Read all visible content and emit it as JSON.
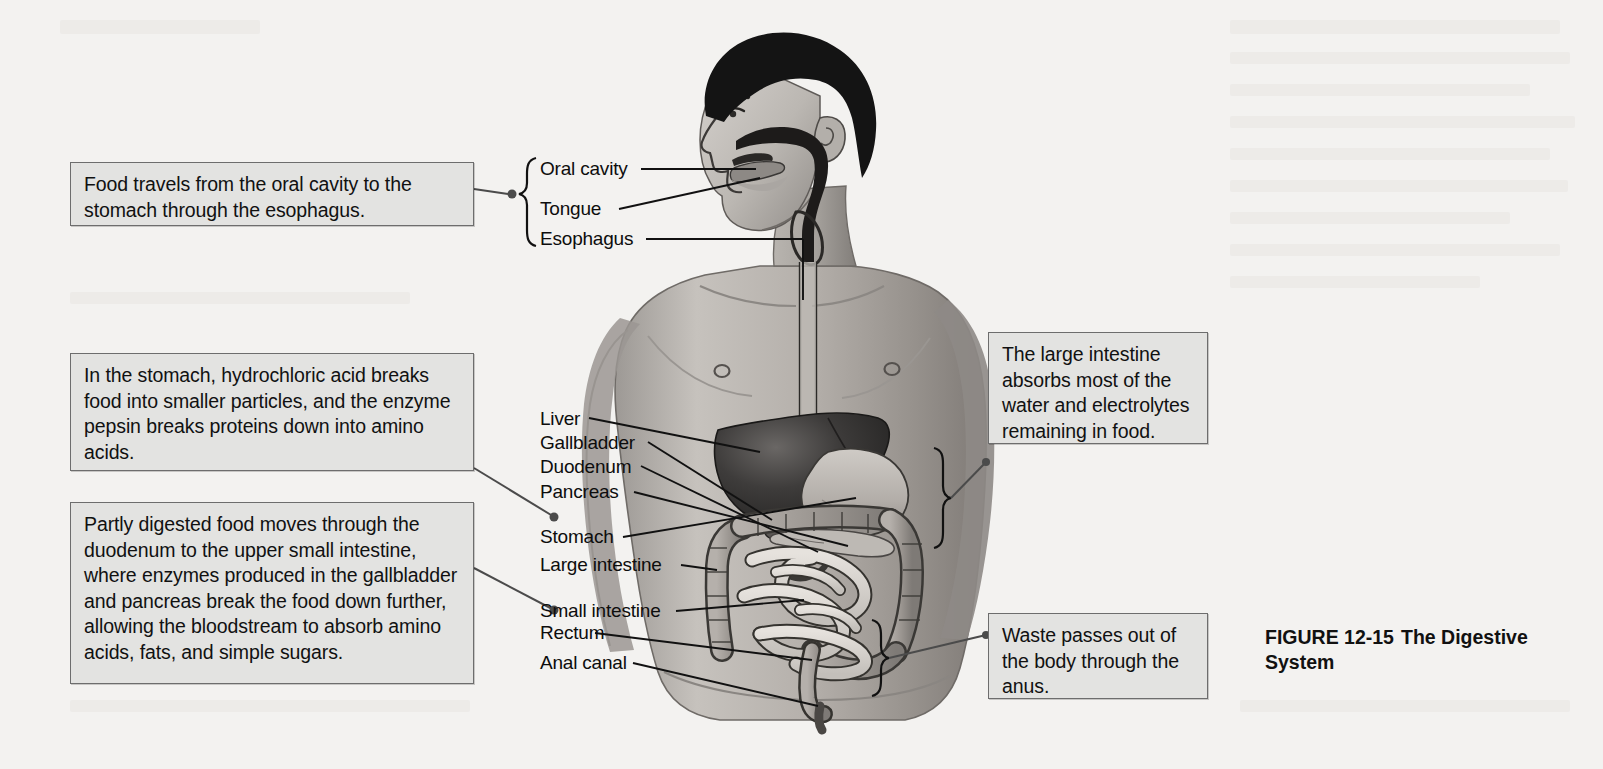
{
  "figure": {
    "number": "FIGURE 12-15",
    "title": "The Digestive System",
    "caption_line2": "System"
  },
  "callouts": [
    {
      "id": "esophagus-callout",
      "text": "Food travels from the oral cavity to the stomach through the esophagus."
    },
    {
      "id": "stomach-callout",
      "text": "In the stomach, hydrochloric acid breaks food into smaller particles, and the enzyme pepsin breaks proteins down into amino acids."
    },
    {
      "id": "duodenum-callout",
      "text": "Partly digested food moves through the duodenum to the upper small intestine, where enzymes produced in the gallbladder and pancreas break the food down further, allowing the bloodstream to absorb amino acids, fats, and simple sugars."
    },
    {
      "id": "large-intestine-callout",
      "text": "The large intestine absorbs most of the water and electrolytes remaining in food."
    },
    {
      "id": "anus-callout",
      "text": "Waste passes out of the body through the anus."
    }
  ],
  "labels": [
    {
      "id": "oral-cavity",
      "text": "Oral cavity"
    },
    {
      "id": "tongue",
      "text": "Tongue"
    },
    {
      "id": "esophagus",
      "text": "Esophagus"
    },
    {
      "id": "liver",
      "text": "Liver"
    },
    {
      "id": "gallbladder",
      "text": "Gallbladder"
    },
    {
      "id": "duodenum",
      "text": "Duodenum"
    },
    {
      "id": "pancreas",
      "text": "Pancreas"
    },
    {
      "id": "stomach",
      "text": "Stomach"
    },
    {
      "id": "large-intestine",
      "text": "Large intestine"
    },
    {
      "id": "small-intestine",
      "text": "Small intestine"
    },
    {
      "id": "rectum",
      "text": "Rectum"
    },
    {
      "id": "anal-canal",
      "text": "Anal canal"
    }
  ],
  "colors": {
    "page_background": "#f3f2f0",
    "callout_fill": "#e3e3e1",
    "callout_border": "#6d6d6d",
    "leader_line": "#111111",
    "skin_light": "#c9c6c2",
    "skin_mid": "#a7a3a0",
    "skin_dark": "#8a8683",
    "hair": "#1b1b1b",
    "liver": "#3f3d3c",
    "intestine_light": "#d8d4cf",
    "intestine_mid": "#b0aba6"
  }
}
